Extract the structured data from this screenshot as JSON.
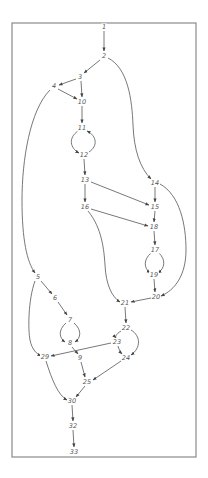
{
  "diagram": {
    "type": "flow-graph",
    "frame": {
      "x": 12,
      "y": 23,
      "width": 184,
      "height": 434,
      "color": "#8a8a8a"
    },
    "edge_color": "#555555",
    "nodes": [
      {
        "id": "1",
        "label": "1",
        "x": 104,
        "y": 27
      },
      {
        "id": "2",
        "label": "2",
        "x": 104,
        "y": 56
      },
      {
        "id": "3",
        "label": "3",
        "x": 80,
        "y": 77
      },
      {
        "id": "4",
        "label": "4",
        "x": 54,
        "y": 86
      },
      {
        "id": "10",
        "label": "10",
        "x": 82,
        "y": 102
      },
      {
        "id": "11",
        "label": "11",
        "x": 82,
        "y": 128
      },
      {
        "id": "12",
        "label": "12",
        "x": 84,
        "y": 155
      },
      {
        "id": "13",
        "label": "13",
        "x": 85,
        "y": 180
      },
      {
        "id": "14",
        "label": "14",
        "x": 155,
        "y": 183
      },
      {
        "id": "15",
        "label": "15",
        "x": 155,
        "y": 207
      },
      {
        "id": "16",
        "label": "16",
        "x": 85,
        "y": 207
      },
      {
        "id": "18",
        "label": "18",
        "x": 154,
        "y": 227
      },
      {
        "id": "17",
        "label": "17",
        "x": 155,
        "y": 250
      },
      {
        "id": "19",
        "label": "19",
        "x": 154,
        "y": 275
      },
      {
        "id": "20",
        "label": "20",
        "x": 156,
        "y": 297
      },
      {
        "id": "21",
        "label": "21",
        "x": 125,
        "y": 303
      },
      {
        "id": "22",
        "label": "22",
        "x": 126,
        "y": 328
      },
      {
        "id": "23",
        "label": "23",
        "x": 117,
        "y": 342
      },
      {
        "id": "24",
        "label": "24",
        "x": 126,
        "y": 358
      },
      {
        "id": "5",
        "label": "5",
        "x": 38,
        "y": 277
      },
      {
        "id": "6",
        "label": "6",
        "x": 55,
        "y": 298
      },
      {
        "id": "7",
        "label": "7",
        "x": 70,
        "y": 320
      },
      {
        "id": "8",
        "label": "8",
        "x": 70,
        "y": 343
      },
      {
        "id": "9",
        "label": "9",
        "x": 80,
        "y": 358
      },
      {
        "id": "29",
        "label": "29",
        "x": 45,
        "y": 357
      },
      {
        "id": "25",
        "label": "25",
        "x": 87,
        "y": 382
      },
      {
        "id": "30",
        "label": "30",
        "x": 72,
        "y": 401
      },
      {
        "id": "32",
        "label": "32",
        "x": 73,
        "y": 426
      },
      {
        "id": "33",
        "label": "33",
        "x": 74,
        "y": 452
      }
    ],
    "edges": [
      {
        "from": "1",
        "to": "2",
        "path": "M104,31 L104,51"
      },
      {
        "from": "2",
        "to": "3",
        "path": "M100,60 L84,73"
      },
      {
        "from": "2",
        "to": "14",
        "path": "M108,58 C128,68 132,100 133,125 C134,150 140,168 151,179"
      },
      {
        "from": "3",
        "to": "4",
        "path": "M76,79 L59,85"
      },
      {
        "from": "3",
        "to": "10",
        "path": "M81,81 L82,97"
      },
      {
        "from": "4",
        "to": "10",
        "path": "M58,89 L77,99"
      },
      {
        "from": "4",
        "to": "5",
        "path": "M50,90 C30,110 22,160 22,200 C22,240 27,262 35,273"
      },
      {
        "from": "10",
        "to": "11",
        "path": "M82,106 L82,123"
      },
      {
        "from": "11",
        "to": "12",
        "path": "M78,131 C68,138 70,148 79,153"
      },
      {
        "from": "12",
        "to": "11",
        "path": "M89,152 C98,146 97,136 87,131"
      },
      {
        "from": "12",
        "to": "13",
        "path": "M84,159 L85,175"
      },
      {
        "from": "13",
        "to": "15",
        "path": "M91,182 L149,205"
      },
      {
        "from": "13",
        "to": "16",
        "path": "M85,184 L85,202"
      },
      {
        "from": "14",
        "to": "15",
        "path": "M155,187 L155,202"
      },
      {
        "from": "14",
        "to": "20",
        "path": "M160,184 C180,195 186,225 186,250 C186,275 175,290 161,296"
      },
      {
        "from": "15",
        "to": "18",
        "path": "M155,211 L154,222"
      },
      {
        "from": "16",
        "to": "18",
        "path": "M91,209 L148,226"
      },
      {
        "from": "16",
        "to": "21",
        "path": "M88,211 C102,228 104,250 105,265 C106,285 112,297 120,302"
      },
      {
        "from": "18",
        "to": "17",
        "path": "M154,231 L155,245"
      },
      {
        "from": "17",
        "to": "19",
        "path": "M151,253 C143,260 144,268 150,273"
      },
      {
        "from": "17",
        "to": "19b",
        "path": "M159,253 C166,260 165,268 158,273"
      },
      {
        "from": "19",
        "to": "20",
        "path": "M154,279 L155,292"
      },
      {
        "from": "20",
        "to": "21",
        "path": "M151,298 L131,302"
      },
      {
        "from": "21",
        "to": "22",
        "path": "M125,307 L126,323"
      },
      {
        "from": "22",
        "to": "23",
        "path": "M121,331 C116,334 115,337 116,338"
      },
      {
        "from": "22",
        "to": "24",
        "path": "M131,330 C141,336 141,348 131,355"
      },
      {
        "from": "23",
        "to": "24",
        "path": "M118,346 C119,350 121,353 122,354"
      },
      {
        "from": "23",
        "to": "29",
        "path": "M111,343 L51,356"
      },
      {
        "from": "24",
        "to": "25",
        "path": "M121,361 L93,380"
      },
      {
        "from": "5",
        "to": "6",
        "path": "M41,281 L52,294"
      },
      {
        "from": "5",
        "to": "29",
        "path": "M35,281 C28,300 28,330 30,340 C32,350 37,354 41,356"
      },
      {
        "from": "6",
        "to": "7",
        "path": "M58,302 L67,315"
      },
      {
        "from": "7",
        "to": "8",
        "path": "M66,323 C58,330 59,338 65,342"
      },
      {
        "from": "7",
        "to": "8b",
        "path": "M74,323 C82,330 81,338 75,342"
      },
      {
        "from": "8",
        "to": "9",
        "path": "M72,347 L78,354"
      },
      {
        "from": "9",
        "to": "25",
        "path": "M81,362 L85,377"
      },
      {
        "from": "29",
        "to": "30",
        "path": "M46,361 C52,380 58,395 67,400"
      },
      {
        "from": "25",
        "to": "30",
        "path": "M85,386 L76,397"
      },
      {
        "from": "30",
        "to": "32",
        "path": "M72,405 L73,421"
      },
      {
        "from": "32",
        "to": "33",
        "path": "M73,430 L74,447"
      }
    ]
  }
}
